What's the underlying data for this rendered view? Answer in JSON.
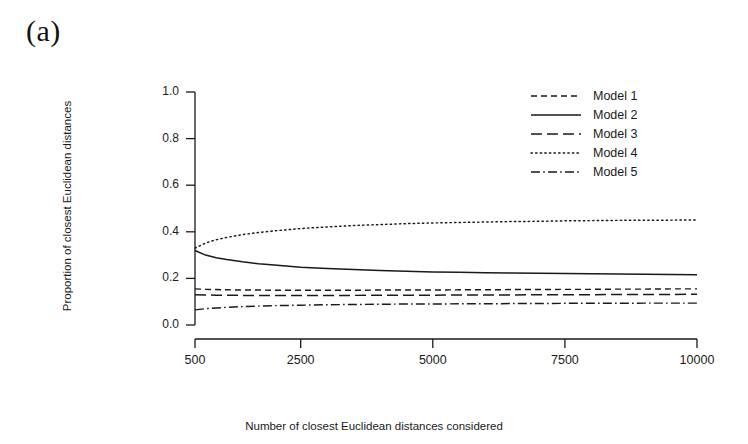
{
  "figure": {
    "panel_label": "(a)",
    "background_color": "#ffffff",
    "line_color": "#1a1a1a"
  },
  "chart_data": {
    "type": "line",
    "title": "",
    "xlabel": "Number of closest Euclidean distances considered",
    "ylabel": "Proportion of closest Euclidean distances",
    "xlim": [
      500,
      10000
    ],
    "ylim": [
      0.0,
      1.0
    ],
    "grid": false,
    "legend_position": "top-right",
    "xticks": [
      500,
      2500,
      5000,
      7500,
      10000
    ],
    "xtick_labels": [
      "500",
      "2500",
      "5000",
      "7500",
      "10000"
    ],
    "yticks": [
      0.0,
      0.2,
      0.4,
      0.6,
      0.8,
      1.0
    ],
    "ytick_labels": [
      "0.0",
      "0.2",
      "0.4",
      "0.6",
      "0.8",
      "1.0"
    ],
    "x": [
      500,
      700,
      900,
      1100,
      1400,
      1700,
      2000,
      2500,
      3000,
      3500,
      4000,
      4500,
      5000,
      5500,
      6000,
      6500,
      7000,
      7500,
      8000,
      8500,
      9000,
      9500,
      10000
    ],
    "series": [
      {
        "name": "Model 1",
        "dash": "dashed",
        "values": [
          0.155,
          0.153,
          0.152,
          0.151,
          0.15,
          0.15,
          0.149,
          0.149,
          0.149,
          0.149,
          0.15,
          0.15,
          0.15,
          0.151,
          0.151,
          0.152,
          0.152,
          0.153,
          0.153,
          0.154,
          0.154,
          0.155,
          0.155
        ]
      },
      {
        "name": "Model 2",
        "dash": "solid",
        "values": [
          0.32,
          0.3,
          0.289,
          0.281,
          0.271,
          0.263,
          0.257,
          0.248,
          0.242,
          0.238,
          0.234,
          0.231,
          0.228,
          0.226,
          0.224,
          0.223,
          0.222,
          0.221,
          0.22,
          0.219,
          0.218,
          0.217,
          0.216
        ]
      },
      {
        "name": "Model 3",
        "dash": "longdash",
        "values": [
          0.13,
          0.129,
          0.128,
          0.128,
          0.127,
          0.127,
          0.127,
          0.127,
          0.127,
          0.127,
          0.128,
          0.128,
          0.128,
          0.129,
          0.129,
          0.129,
          0.13,
          0.13,
          0.13,
          0.131,
          0.131,
          0.131,
          0.132
        ]
      },
      {
        "name": "Model 4",
        "dash": "dotted",
        "values": [
          0.33,
          0.352,
          0.366,
          0.376,
          0.388,
          0.397,
          0.404,
          0.414,
          0.421,
          0.427,
          0.431,
          0.435,
          0.438,
          0.44,
          0.442,
          0.444,
          0.445,
          0.447,
          0.448,
          0.449,
          0.45,
          0.45,
          0.451
        ]
      },
      {
        "name": "Model 5",
        "dash": "dashdot",
        "values": [
          0.065,
          0.07,
          0.073,
          0.076,
          0.079,
          0.081,
          0.083,
          0.085,
          0.087,
          0.088,
          0.089,
          0.09,
          0.09,
          0.091,
          0.091,
          0.092,
          0.092,
          0.093,
          0.093,
          0.093,
          0.094,
          0.094,
          0.094
        ]
      }
    ]
  },
  "legend": {
    "entries": [
      {
        "label": "Model 1",
        "dash": "dashed"
      },
      {
        "label": "Model 2",
        "dash": "solid"
      },
      {
        "label": "Model 3",
        "dash": "longdash"
      },
      {
        "label": "Model 4",
        "dash": "dotted"
      },
      {
        "label": "Model 5",
        "dash": "dashdot"
      }
    ]
  }
}
